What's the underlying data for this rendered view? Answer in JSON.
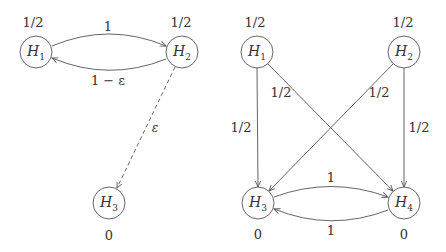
{
  "diagrams": [
    {
      "id": "left",
      "nodes": [
        {
          "id": "H1",
          "name": "H",
          "sub": "1",
          "x": 36,
          "y": 52,
          "value": "1/2",
          "value_pos": "above"
        },
        {
          "id": "H2",
          "name": "H",
          "sub": "2",
          "x": 182,
          "y": 52,
          "value": "1/2",
          "value_pos": "above"
        },
        {
          "id": "H3",
          "name": "H",
          "sub": "3",
          "x": 109,
          "y": 203,
          "value": "0",
          "value_pos": "below"
        }
      ],
      "edges": [
        {
          "from": "H1",
          "to": "H2",
          "label": "1",
          "style": "solid",
          "curve": "up"
        },
        {
          "from": "H2",
          "to": "H1",
          "label": "1 − ε",
          "style": "solid",
          "curve": "down"
        },
        {
          "from": "H2",
          "to": "H3",
          "label": "ε",
          "style": "dashed",
          "curve": "none"
        }
      ]
    },
    {
      "id": "right",
      "nodes": [
        {
          "id": "H1",
          "name": "H",
          "sub": "1",
          "x": 257,
          "y": 52,
          "value": "1/2",
          "value_pos": "above"
        },
        {
          "id": "H2",
          "name": "H",
          "sub": "2",
          "x": 404,
          "y": 52,
          "value": "1/2",
          "value_pos": "above"
        },
        {
          "id": "H3",
          "name": "H",
          "sub": "3",
          "x": 258,
          "y": 203,
          "value": "0",
          "value_pos": "below"
        },
        {
          "id": "H4",
          "name": "H",
          "sub": "4",
          "x": 404,
          "y": 203,
          "value": "0",
          "value_pos": "below"
        }
      ],
      "edges": [
        {
          "from": "H1",
          "to": "H3",
          "label": "1/2",
          "style": "solid",
          "curve": "none"
        },
        {
          "from": "H1",
          "to": "H4",
          "label": "1/2",
          "style": "solid",
          "curve": "none"
        },
        {
          "from": "H2",
          "to": "H3",
          "label": "1/2",
          "style": "solid",
          "curve": "none"
        },
        {
          "from": "H2",
          "to": "H4",
          "label": "1/2",
          "style": "solid",
          "curve": "none"
        },
        {
          "from": "H3",
          "to": "H4",
          "label": "1",
          "style": "solid",
          "curve": "up"
        },
        {
          "from": "H4",
          "to": "H3",
          "label": "1",
          "style": "solid",
          "curve": "down"
        }
      ]
    }
  ],
  "labels": {
    "left_h1_value": "1/2",
    "left_h2_value": "1/2",
    "left_h3_value": "0",
    "left_e12": "1",
    "left_e21": "1 − ε",
    "left_e23": "ε",
    "right_h1_value": "1/2",
    "right_h2_value": "1/2",
    "right_h3_value": "0",
    "right_h4_value": "0",
    "right_e13": "1/2",
    "right_e14": "1/2",
    "right_e23": "1/2",
    "right_e24": "1/2",
    "right_e34": "1",
    "right_e43": "1",
    "node_letter": "H",
    "sub1": "1",
    "sub2": "2",
    "sub3": "3",
    "sub4": "4"
  },
  "colors": {
    "stroke": "#555555",
    "text": "#333333",
    "background": "#ffffff"
  }
}
